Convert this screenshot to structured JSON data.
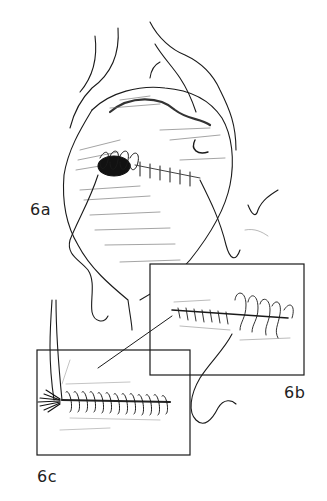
{
  "figure": {
    "panels": [
      {
        "id": "6a",
        "label": "6a",
        "description": "Operative view of opened cavity with running suture closing a defect"
      },
      {
        "id": "6b",
        "label": "6b",
        "description": "Inset: running suture with loops being tightened"
      },
      {
        "id": "6c",
        "label": "6c",
        "description": "Inset: completed twisted/locked suture line with frayed end"
      }
    ],
    "colors": {
      "ink": "#1a1a1a",
      "paper": "#ffffff",
      "shade": "#555555"
    }
  }
}
